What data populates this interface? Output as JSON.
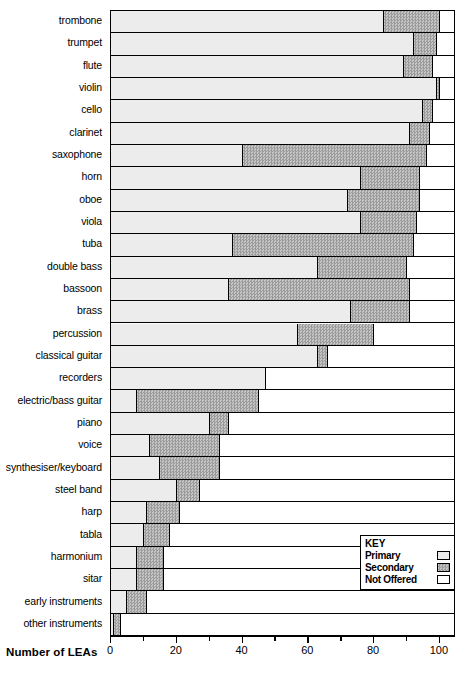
{
  "chart_data": {
    "type": "bar",
    "orientation": "horizontal",
    "stacked": true,
    "title": "",
    "xlabel": "Number of LEAs",
    "ylabel": "",
    "xlim": [
      0,
      104
    ],
    "xticks": [
      0,
      20,
      40,
      60,
      80,
      100
    ],
    "xtick_labels": [
      "0",
      "20",
      "40",
      "60",
      "80",
      "100"
    ],
    "minor_tick_step": 10,
    "grid": false,
    "legend_position": "bottom-right",
    "legend_title": "KEY",
    "categories": [
      "trombone",
      "trumpet",
      "flute",
      "violin",
      "cello",
      "clarinet",
      "saxophone",
      "horn",
      "oboe",
      "viola",
      "tuba",
      "double bass",
      "bassoon",
      "brass",
      "percussion",
      "classical guitar",
      "recorders",
      "electric/bass guitar",
      "piano",
      "voice",
      "synthesiser/keyboard",
      "steel band",
      "harp",
      "tabla",
      "harmonium",
      "sitar",
      "early instruments",
      "other instruments"
    ],
    "series": [
      {
        "name": "Primary",
        "color": "#ececec",
        "values": [
          83,
          92,
          89,
          99,
          95,
          91,
          40,
          76,
          72,
          76,
          37,
          63,
          36,
          73,
          57,
          63,
          47,
          8,
          30,
          12,
          15,
          20,
          11,
          10,
          8,
          8,
          5,
          1
        ]
      },
      {
        "name": "Secondary",
        "color": "#b0b0b0",
        "values": [
          17,
          7,
          9,
          1,
          3,
          6,
          56,
          18,
          22,
          17,
          55,
          27,
          55,
          18,
          23,
          3,
          0,
          37,
          6,
          21,
          18,
          7,
          10,
          8,
          8,
          8,
          6,
          2
        ]
      },
      {
        "name": "Not Offered",
        "color": "#ffffff",
        "values": [
          4,
          5,
          6,
          4,
          6,
          7,
          8,
          10,
          10,
          11,
          12,
          14,
          13,
          13,
          24,
          38,
          57,
          59,
          68,
          71,
          71,
          77,
          83,
          86,
          88,
          88,
          93,
          101
        ]
      }
    ],
    "totals_plot_max": 104
  },
  "legend": {
    "title": "KEY",
    "items": [
      {
        "label": "Primary",
        "swatch": "primary"
      },
      {
        "label": "Secondary",
        "swatch": "secondary"
      },
      {
        "label": "Not Offered",
        "swatch": "notoffered"
      }
    ]
  },
  "axis": {
    "title": "Number of LEAs"
  }
}
